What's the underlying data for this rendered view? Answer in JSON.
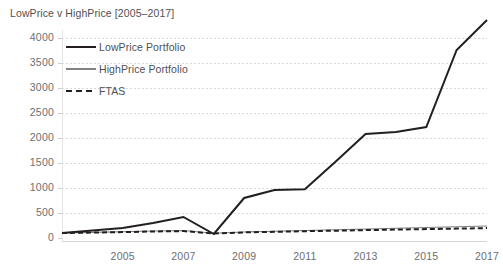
{
  "chart_data": {
    "type": "line",
    "title": "LowPrice v HighPrice [2005–2017]",
    "xlabel": "",
    "ylabel": "",
    "grid": true,
    "grid_axis": "y",
    "legend_position": "top-left inside plot",
    "x": [
      2003,
      2004,
      2005,
      2006,
      2007,
      2008,
      2009,
      2010,
      2011,
      2012,
      2013,
      2014,
      2015,
      2016,
      2017
    ],
    "xlim": [
      2003,
      2017
    ],
    "ylim": [
      0,
      4500
    ],
    "xticks": [
      2005,
      2007,
      2009,
      2011,
      2013,
      2015,
      2017
    ],
    "xtick_labels": [
      "2005",
      "2007",
      "2009",
      "2011",
      "2013",
      "2015",
      "2017"
    ],
    "yticks": [
      0,
      500,
      1000,
      1500,
      2000,
      2500,
      3000,
      3500,
      4000
    ],
    "ytick_labels": [
      "0",
      "500",
      "1000",
      "1500",
      "2000",
      "2500",
      "3000",
      "3500",
      "4000"
    ],
    "series": [
      {
        "name": "LowPrice Portfolio",
        "color": "#231f20",
        "style": "solid",
        "width": 2.0,
        "values": [
          100,
          150,
          200,
          300,
          420,
          80,
          800,
          960,
          975,
          1520,
          2080,
          2120,
          2220,
          3760,
          4360
        ]
      },
      {
        "name": "HighPrice Portfolio",
        "color": "#808285",
        "style": "solid",
        "width": 1.2,
        "values": [
          100,
          112,
          125,
          140,
          150,
          95,
          120,
          135,
          150,
          165,
          180,
          195,
          210,
          225,
          240
        ]
      },
      {
        "name": "FTAS",
        "color": "#231f20",
        "style": "dashed",
        "width": 2.0,
        "values": [
          100,
          108,
          118,
          130,
          138,
          90,
          112,
          124,
          136,
          146,
          158,
          168,
          178,
          188,
          198
        ]
      }
    ]
  },
  "legend": {
    "items": [
      {
        "label": "LowPrice Portfolio",
        "color": "#231f20",
        "style": "solid",
        "width": 2.4
      },
      {
        "label": "HighPrice Portfolio",
        "color": "#808285",
        "style": "solid",
        "width": 1.4
      },
      {
        "label": "FTAS",
        "color": "#231f20",
        "style": "dashed",
        "width": 2.4
      }
    ]
  },
  "colors": {
    "grid": "#d9d9d9",
    "axis": "#d4d4d4",
    "tick_text": "#6d6e71",
    "title_text": "#4f5052"
  }
}
